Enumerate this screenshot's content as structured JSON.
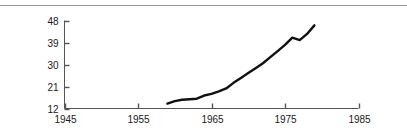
{
  "figure": {
    "background_color": "#ffffff",
    "rule_color": "#9a9a9a",
    "axis_color": "#555555",
    "line_color": "#111111"
  },
  "chart_data": {
    "type": "line",
    "title": "",
    "subtitle": "",
    "xlabel": "",
    "ylabel": "",
    "xlim": [
      1945,
      1985
    ],
    "ylim": [
      12,
      48
    ],
    "grid": false,
    "legend": null,
    "xticks": [
      1945,
      1955,
      1965,
      1975,
      1985
    ],
    "xtick_labels": [
      "1945",
      "1955",
      "1965",
      "1975",
      "1985"
    ],
    "yticks": [
      12,
      21,
      30,
      39,
      48
    ],
    "ytick_labels": [
      "12",
      "21",
      "30",
      "39",
      "48"
    ],
    "series": [
      {
        "name": "series-1",
        "color": "#111111",
        "x": [
          1959,
          1960,
          1961,
          1962,
          1963,
          1964,
          1965,
          1966,
          1967,
          1968,
          1969,
          1970,
          1971,
          1972,
          1973,
          1974,
          1975,
          1976,
          1977,
          1978,
          1979
        ],
        "y": [
          14.0,
          15.0,
          15.6,
          15.8,
          16.0,
          17.3,
          18.0,
          19.0,
          20.2,
          22.5,
          24.5,
          26.5,
          28.5,
          30.5,
          33.0,
          35.5,
          38.0,
          41.0,
          40.0,
          42.5,
          46.0
        ]
      }
    ]
  }
}
